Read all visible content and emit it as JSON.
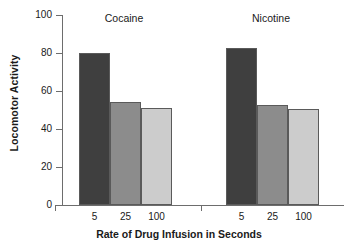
{
  "chart_data": {
    "type": "bar",
    "title": "",
    "xlabel": "Rate of Drug Infusion in Seconds",
    "ylabel": "Locomotor Activity",
    "categories": [
      "5",
      "25",
      "100"
    ],
    "ylim": [
      0,
      100
    ],
    "yticks": [
      0,
      20,
      40,
      60,
      80,
      100
    ],
    "ytick_labels": [
      "0",
      "20",
      "40",
      "60",
      "80",
      "100"
    ],
    "grid": false,
    "legend": "none",
    "groups": [
      {
        "name": "Cocaine",
        "values": [
          80,
          54,
          51
        ],
        "colors": [
          "#3f3f3f",
          "#8c8c8c",
          "#cccccc"
        ]
      },
      {
        "name": "Nicotine",
        "values": [
          82.5,
          52.5,
          50.5
        ],
        "colors": [
          "#3f3f3f",
          "#8c8c8c",
          "#cccccc"
        ]
      }
    ],
    "bar_colors": {
      "rate_5": "#3f3f3f",
      "rate_25": "#8c8c8c",
      "rate_100": "#cccccc",
      "bar_outline": "#5a5a5a",
      "axis": "#6d6d6d"
    }
  }
}
